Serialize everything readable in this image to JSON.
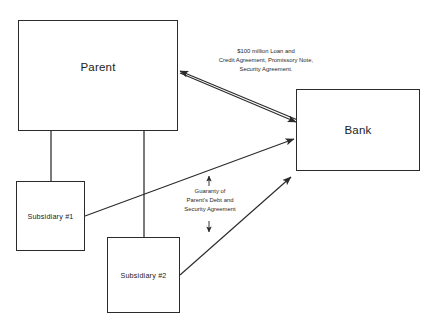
{
  "diagram": {
    "nodes": {
      "parent": {
        "label": "Parent"
      },
      "bank": {
        "label": "Bank"
      },
      "subsidiary_1": {
        "label": "Subsidiary #1"
      },
      "subsidiary_2": {
        "label": "Subsidiary #2"
      }
    },
    "edge_labels": {
      "loan": {
        "line1": "$100 million Loan and",
        "line2": "Credit Agreement, Promissory Note,",
        "line3": "Security Agreement."
      },
      "guaranty": {
        "line1": "Guaranty of",
        "line2": "Parent's Debt and",
        "line3": "Security Agreement"
      }
    },
    "colors": {
      "stroke": "#2b2b2b",
      "text": "#222222",
      "background": "#ffffff"
    }
  }
}
